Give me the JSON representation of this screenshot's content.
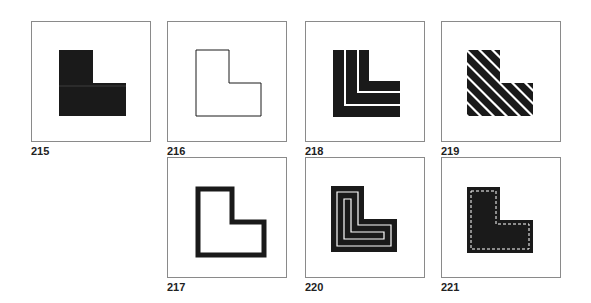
{
  "figures": [
    {
      "id": "215",
      "style": "solid",
      "label": "215"
    },
    {
      "id": "216",
      "style": "outline-thin",
      "label": "216"
    },
    {
      "id": "218",
      "style": "parallel-bands",
      "label": "218"
    },
    {
      "id": "219",
      "style": "diagonal-stripes",
      "label": "219"
    },
    {
      "id": "217",
      "style": "outline-thick",
      "label": "217"
    },
    {
      "id": "220",
      "style": "concentric-outlines",
      "label": "220"
    },
    {
      "id": "221",
      "style": "solid-dashed-inset",
      "label": "221"
    }
  ],
  "colors": {
    "ink": "#1a1a1a",
    "frame": "#8a8a8a",
    "paper": "#ffffff"
  }
}
